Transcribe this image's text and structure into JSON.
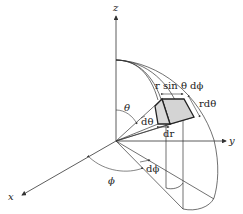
{
  "diagram": {
    "axes": {
      "x": "x",
      "y": "y",
      "z": "z"
    },
    "angles": {
      "theta": "θ",
      "phi": "ϕ",
      "dtheta": "dθ",
      "dphi": "dϕ"
    },
    "element_edges": {
      "r_sin_theta_dphi": "r sin θ dϕ",
      "r_dtheta": "rdθ",
      "dr": "dr"
    },
    "colors": {
      "line": "#333333",
      "shade": "#d4d4d4",
      "background": "#ffffff"
    }
  }
}
